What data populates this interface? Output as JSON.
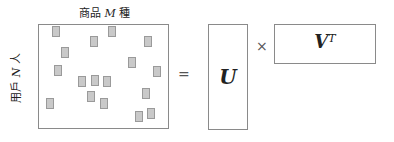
{
  "matrix_R": {
    "title_prefix": "商品 ",
    "title_var": "M",
    "title_suffix": " 種",
    "ylabel_prefix": "用戶 ",
    "ylabel_var": "N",
    "ylabel_suffix": " 人",
    "nonzero_cells": 17
  },
  "operators": {
    "equals": "=",
    "times": "×"
  },
  "matrix_U": {
    "label": "U"
  },
  "matrix_V": {
    "label": "V",
    "superscript": "T"
  }
}
